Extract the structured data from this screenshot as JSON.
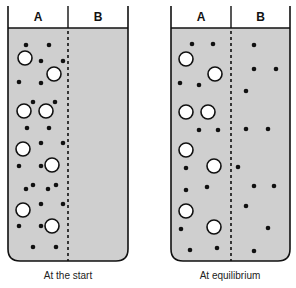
{
  "diagram": {
    "colors": {
      "fluid": "#cfcfcf",
      "outline": "#111111",
      "small_particle": "#111111",
      "large_particle_fill": "#ffffff"
    },
    "panels": [
      {
        "id": "start",
        "caption": "At the start",
        "compartment_labels": [
          "A",
          "B"
        ],
        "box": {
          "x": 8,
          "y": 28,
          "w": 120,
          "h": 233,
          "divider_x": 68
        },
        "large_particles": [
          {
            "x": 25,
            "y": 58
          },
          {
            "x": 54,
            "y": 74
          },
          {
            "x": 24,
            "y": 111
          },
          {
            "x": 46,
            "y": 111
          },
          {
            "x": 23,
            "y": 149
          },
          {
            "x": 52,
            "y": 165
          },
          {
            "x": 23,
            "y": 210
          },
          {
            "x": 52,
            "y": 226
          }
        ],
        "small_particles": [
          {
            "x": 26,
            "y": 45
          },
          {
            "x": 49,
            "y": 45
          },
          {
            "x": 41,
            "y": 61
          },
          {
            "x": 63,
            "y": 61
          },
          {
            "x": 19,
            "y": 82
          },
          {
            "x": 41,
            "y": 83
          },
          {
            "x": 33,
            "y": 102
          },
          {
            "x": 55,
            "y": 102
          },
          {
            "x": 27,
            "y": 128
          },
          {
            "x": 49,
            "y": 128
          },
          {
            "x": 41,
            "y": 143
          },
          {
            "x": 63,
            "y": 143
          },
          {
            "x": 19,
            "y": 166
          },
          {
            "x": 41,
            "y": 166
          },
          {
            "x": 26,
            "y": 189
          },
          {
            "x": 33,
            "y": 185
          },
          {
            "x": 48,
            "y": 189
          },
          {
            "x": 56,
            "y": 185
          },
          {
            "x": 41,
            "y": 204
          },
          {
            "x": 63,
            "y": 204
          },
          {
            "x": 19,
            "y": 226
          },
          {
            "x": 41,
            "y": 226
          },
          {
            "x": 33,
            "y": 247
          },
          {
            "x": 56,
            "y": 247
          }
        ]
      },
      {
        "id": "equilibrium",
        "caption": "At equilibrium",
        "compartment_labels": [
          "A",
          "B"
        ],
        "box": {
          "x": 171,
          "y": 28,
          "w": 119,
          "h": 233,
          "divider_x": 231
        },
        "large_particles": [
          {
            "x": 186,
            "y": 59
          },
          {
            "x": 215,
            "y": 74
          },
          {
            "x": 186,
            "y": 112
          },
          {
            "x": 208,
            "y": 112
          },
          {
            "x": 186,
            "y": 150
          },
          {
            "x": 214,
            "y": 166
          },
          {
            "x": 186,
            "y": 211
          },
          {
            "x": 214,
            "y": 227
          }
        ],
        "small_particles": [
          {
            "x": 192,
            "y": 44
          },
          {
            "x": 213,
            "y": 44
          },
          {
            "x": 180,
            "y": 83
          },
          {
            "x": 199,
            "y": 85
          },
          {
            "x": 199,
            "y": 130
          },
          {
            "x": 218,
            "y": 130
          },
          {
            "x": 186,
            "y": 168
          },
          {
            "x": 186,
            "y": 190
          },
          {
            "x": 207,
            "y": 187
          },
          {
            "x": 181,
            "y": 229
          },
          {
            "x": 190,
            "y": 250
          },
          {
            "x": 217,
            "y": 248
          },
          {
            "x": 254,
            "y": 45
          },
          {
            "x": 254,
            "y": 69
          },
          {
            "x": 276,
            "y": 69
          },
          {
            "x": 246,
            "y": 91
          },
          {
            "x": 246,
            "y": 129
          },
          {
            "x": 268,
            "y": 129
          },
          {
            "x": 238,
            "y": 167
          },
          {
            "x": 254,
            "y": 186
          },
          {
            "x": 274,
            "y": 186
          },
          {
            "x": 246,
            "y": 206
          },
          {
            "x": 268,
            "y": 228
          },
          {
            "x": 254,
            "y": 251
          }
        ]
      }
    ]
  }
}
